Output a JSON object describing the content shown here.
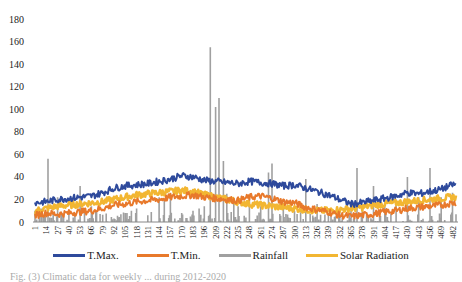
{
  "chart_data": {
    "type": "line",
    "title": "",
    "xlabel": "Week",
    "ylabel": "",
    "ylim": [
      0,
      180
    ],
    "yticks": [
      0,
      20,
      40,
      60,
      80,
      100,
      120,
      140,
      160,
      180
    ],
    "xticks": [
      1,
      14,
      27,
      40,
      53,
      66,
      79,
      92,
      105,
      118,
      131,
      144,
      157,
      170,
      183,
      196,
      209,
      222,
      235,
      248,
      261,
      274,
      287,
      300,
      313,
      326,
      339,
      352,
      365,
      378,
      391,
      404,
      417,
      430,
      443,
      456,
      469,
      482
    ],
    "x_range": [
      1,
      486
    ],
    "grid": false,
    "legend_position": "bottom",
    "series": [
      {
        "name": "T.Max.",
        "type": "line",
        "color": "#2E4A9C",
        "points": [
          [
            1,
            17
          ],
          [
            14,
            18
          ],
          [
            27,
            20
          ],
          [
            40,
            21
          ],
          [
            53,
            22
          ],
          [
            66,
            23
          ],
          [
            79,
            26
          ],
          [
            92,
            30
          ],
          [
            105,
            32
          ],
          [
            118,
            33
          ],
          [
            131,
            34
          ],
          [
            144,
            36
          ],
          [
            157,
            38
          ],
          [
            170,
            41
          ],
          [
            183,
            40
          ],
          [
            196,
            37
          ],
          [
            209,
            36
          ],
          [
            222,
            35
          ],
          [
            235,
            34
          ],
          [
            248,
            36
          ],
          [
            261,
            35
          ],
          [
            274,
            34
          ],
          [
            287,
            32
          ],
          [
            300,
            33
          ],
          [
            313,
            30
          ],
          [
            326,
            27
          ],
          [
            339,
            24
          ],
          [
            352,
            20
          ],
          [
            365,
            16
          ],
          [
            378,
            17
          ],
          [
            391,
            19
          ],
          [
            404,
            21
          ],
          [
            417,
            23
          ],
          [
            430,
            26
          ],
          [
            443,
            25
          ],
          [
            456,
            27
          ],
          [
            469,
            29
          ],
          [
            482,
            33
          ]
        ]
      },
      {
        "name": "T.Min.",
        "type": "line",
        "color": "#E8792B",
        "points": [
          [
            1,
            6
          ],
          [
            14,
            8
          ],
          [
            27,
            7
          ],
          [
            40,
            8
          ],
          [
            53,
            9
          ],
          [
            66,
            10
          ],
          [
            79,
            12
          ],
          [
            92,
            15
          ],
          [
            105,
            16
          ],
          [
            118,
            18
          ],
          [
            131,
            19
          ],
          [
            144,
            20
          ],
          [
            157,
            22
          ],
          [
            170,
            23
          ],
          [
            183,
            24
          ],
          [
            196,
            22
          ],
          [
            209,
            21
          ],
          [
            222,
            20
          ],
          [
            235,
            19
          ],
          [
            248,
            22
          ],
          [
            261,
            23
          ],
          [
            274,
            21
          ],
          [
            287,
            18
          ],
          [
            300,
            17
          ],
          [
            313,
            13
          ],
          [
            326,
            11
          ],
          [
            339,
            9
          ],
          [
            352,
            6
          ],
          [
            365,
            5
          ],
          [
            378,
            6
          ],
          [
            391,
            7
          ],
          [
            404,
            9
          ],
          [
            417,
            10
          ],
          [
            430,
            12
          ],
          [
            443,
            13
          ],
          [
            456,
            14
          ],
          [
            469,
            15
          ],
          [
            482,
            17
          ]
        ]
      },
      {
        "name": "Rainfall",
        "type": "bar",
        "color": "#A0A0A0",
        "points": [
          [
            1,
            10
          ],
          [
            8,
            12
          ],
          [
            16,
            56
          ],
          [
            22,
            8
          ],
          [
            27,
            22
          ],
          [
            34,
            6
          ],
          [
            40,
            10
          ],
          [
            47,
            8
          ],
          [
            53,
            32
          ],
          [
            58,
            12
          ],
          [
            66,
            14
          ],
          [
            72,
            10
          ],
          [
            79,
            6
          ],
          [
            92,
            2
          ],
          [
            105,
            8
          ],
          [
            112,
            10
          ],
          [
            118,
            12
          ],
          [
            131,
            6
          ],
          [
            144,
            22
          ],
          [
            150,
            20
          ],
          [
            157,
            26
          ],
          [
            170,
            8
          ],
          [
            183,
            10
          ],
          [
            190,
            12
          ],
          [
            196,
            14
          ],
          [
            203,
            155
          ],
          [
            209,
            102
          ],
          [
            213,
            110
          ],
          [
            218,
            54
          ],
          [
            222,
            25
          ],
          [
            230,
            18
          ],
          [
            235,
            14
          ],
          [
            248,
            20
          ],
          [
            261,
            14
          ],
          [
            270,
            44
          ],
          [
            274,
            52
          ],
          [
            287,
            14
          ],
          [
            300,
            10
          ],
          [
            313,
            38
          ],
          [
            326,
            16
          ],
          [
            339,
            8
          ],
          [
            352,
            12
          ],
          [
            365,
            10
          ],
          [
            372,
            48
          ],
          [
            378,
            14
          ],
          [
            391,
            32
          ],
          [
            404,
            14
          ],
          [
            417,
            20
          ],
          [
            430,
            40
          ],
          [
            443,
            22
          ],
          [
            456,
            48
          ],
          [
            469,
            22
          ],
          [
            482,
            26
          ]
        ]
      },
      {
        "name": "Solar Radiation",
        "type": "line",
        "color": "#F2B632",
        "points": [
          [
            1,
            10
          ],
          [
            14,
            12
          ],
          [
            27,
            14
          ],
          [
            40,
            15
          ],
          [
            53,
            16
          ],
          [
            66,
            17
          ],
          [
            79,
            18
          ],
          [
            92,
            20
          ],
          [
            105,
            22
          ],
          [
            118,
            24
          ],
          [
            131,
            25
          ],
          [
            144,
            26
          ],
          [
            157,
            27
          ],
          [
            170,
            28
          ],
          [
            183,
            27
          ],
          [
            196,
            24
          ],
          [
            209,
            22
          ],
          [
            222,
            20
          ],
          [
            235,
            18
          ],
          [
            248,
            16
          ],
          [
            261,
            15
          ],
          [
            274,
            14
          ],
          [
            287,
            13
          ],
          [
            300,
            12
          ],
          [
            313,
            11
          ],
          [
            326,
            10
          ],
          [
            339,
            10
          ],
          [
            352,
            11
          ],
          [
            365,
            12
          ],
          [
            378,
            13
          ],
          [
            391,
            15
          ],
          [
            404,
            16
          ],
          [
            417,
            17
          ],
          [
            430,
            18
          ],
          [
            443,
            19
          ],
          [
            456,
            20
          ],
          [
            469,
            21
          ],
          [
            482,
            22
          ]
        ]
      }
    ]
  },
  "legend": {
    "items": [
      {
        "label": "T.Max.",
        "color": "#2E4A9C"
      },
      {
        "label": "T.Min.",
        "color": "#E8792B"
      },
      {
        "label": "Rainfall",
        "color": "#A0A0A0"
      },
      {
        "label": "Solar Radiation",
        "color": "#F2B632"
      }
    ]
  },
  "caption": "Fig. (3) Climatic data for weekly ... during 2012-2020"
}
